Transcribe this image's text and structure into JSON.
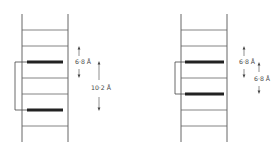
{
  "figure": {
    "panels": [
      {
        "id": "left",
        "rung_count": 7,
        "highlighted_rungs": [
          2,
          5
        ],
        "labels": {
          "spacing_small": "6·8 Å",
          "spacing_large": "10·2 Å"
        }
      },
      {
        "id": "right",
        "rung_count": 7,
        "highlighted_rungs": [
          2,
          4
        ],
        "labels": {
          "spacing_upper": "6·8 Å",
          "spacing_lower": "6·8 Å"
        }
      }
    ]
  },
  "colors": {
    "line": "#555555",
    "highlight": "#222222",
    "background": "#ffffff"
  }
}
